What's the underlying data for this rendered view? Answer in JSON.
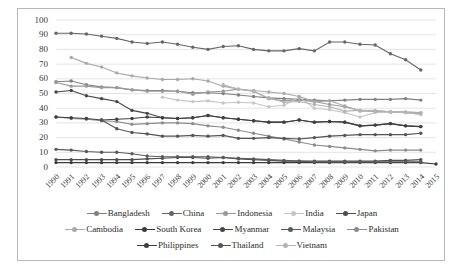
{
  "chart_data": {
    "type": "line",
    "title": "",
    "xlabel": "",
    "ylabel": "",
    "ylim": [
      0,
      100
    ],
    "ytick_step": 10,
    "yticks": [
      0,
      10,
      20,
      30,
      40,
      50,
      60,
      70,
      80,
      90,
      100
    ],
    "grid": true,
    "grid_axis": "y",
    "legend_position": "bottom",
    "x": [
      1990,
      1991,
      1992,
      1993,
      1994,
      1995,
      1996,
      1997,
      1998,
      1999,
      2000,
      2001,
      2002,
      2003,
      2004,
      2005,
      2006,
      2007,
      2008,
      2009,
      2010,
      2011,
      2012,
      2013,
      2014,
      2015
    ],
    "categories": [
      "1990",
      "1991",
      "1992",
      "1993",
      "1994",
      "1995",
      "1996",
      "1997",
      "1998",
      "1999",
      "2000",
      "2001",
      "2002",
      "2003",
      "2004",
      "2005",
      "2006",
      "2007",
      "2008",
      "2009",
      "2010",
      "2011",
      "2012",
      "2013",
      "2014",
      "2015"
    ],
    "series": [
      {
        "name": "Bangladesh",
        "color": "#808080",
        "values": [
          58,
          58.5,
          56,
          54.5,
          54,
          52.5,
          52,
          52,
          51.5,
          50.5,
          50.5,
          50,
          49,
          48,
          47,
          46.5,
          46,
          45.5,
          45,
          45.5,
          46,
          46,
          46,
          46.5,
          45.5,
          null
        ]
      },
      {
        "name": "China",
        "color": "#666666",
        "values": [
          91,
          91,
          90.5,
          89,
          87.5,
          85,
          84,
          85,
          83.5,
          81.5,
          80,
          82,
          82.5,
          80,
          79,
          79,
          80.5,
          79,
          85,
          85,
          83.5,
          83,
          77,
          73,
          66,
          null
        ]
      },
      {
        "name": "Indonesia",
        "color": "#9a9a9a",
        "values": [
          57.5,
          55,
          55,
          54,
          54,
          52.5,
          51.5,
          51.5,
          51.5,
          49.5,
          51,
          51.5,
          53,
          51.5,
          46.5,
          45,
          45.5,
          44.5,
          42.5,
          41,
          38.5,
          38,
          37.5,
          37,
          36,
          null
        ]
      },
      {
        "name": "India",
        "color": "#c6c6c6",
        "values": [
          null,
          null,
          null,
          null,
          null,
          null,
          null,
          47.5,
          45.5,
          44.5,
          45,
          43.5,
          44,
          43.5,
          41,
          42,
          47.5,
          40,
          39,
          37,
          34,
          37,
          37.5,
          37,
          36.5,
          null
        ]
      },
      {
        "name": "Japan",
        "color": "#4d4d4d",
        "values": [
          5,
          5,
          5,
          5,
          5,
          5,
          5.5,
          6,
          6.5,
          6.5,
          6,
          6.5,
          5.5,
          5,
          4.5,
          4,
          4,
          4,
          4,
          4,
          4,
          4,
          4.5,
          4.5,
          5,
          null
        ]
      },
      {
        "name": "Cambodia",
        "color": "#a9a9a9",
        "values": [
          null,
          74.5,
          70.5,
          68,
          64,
          62,
          60.5,
          59.5,
          59.5,
          60,
          58.5,
          55,
          53,
          52,
          51,
          50,
          48,
          44.5,
          45,
          41.5,
          38,
          38,
          37.5,
          37.5,
          37,
          null
        ]
      },
      {
        "name": "South Korea",
        "color": "#3b3b3b",
        "values": [
          3,
          3,
          3,
          3,
          3,
          3,
          3,
          3,
          3,
          3,
          3,
          3,
          3,
          3,
          3,
          3,
          3,
          3,
          3,
          3,
          3,
          3,
          3,
          3,
          3,
          2
        ]
      },
      {
        "name": "Myanmar",
        "color": "#464646",
        "values": [
          51,
          52,
          48.5,
          46.5,
          44.5,
          38.5,
          36.5,
          33.5,
          33,
          33.5,
          35,
          33.5,
          32.5,
          31.5,
          30.5,
          30.5,
          32,
          30.5,
          31,
          30.5,
          28,
          28.5,
          29.5,
          28,
          27.5,
          null
        ]
      },
      {
        "name": "Malaysia",
        "color": "#5a5a5a",
        "values": [
          12,
          11.5,
          10.5,
          10,
          10,
          9,
          7.5,
          7,
          7,
          7,
          7,
          6.5,
          6,
          5.5,
          5,
          4.5,
          4,
          3.5,
          3.5,
          3.5,
          3.5,
          3.5,
          3.5,
          3.5,
          3.5,
          null
        ]
      },
      {
        "name": "Pakistan",
        "color": "#8c8c8c",
        "values": [
          34,
          33,
          32.5,
          31.5,
          31,
          29,
          29.5,
          30,
          30,
          29.5,
          28,
          27,
          25,
          23,
          21,
          19,
          17,
          15,
          14,
          13,
          12,
          11,
          11.5,
          11.5,
          11.5,
          null
        ]
      },
      {
        "name": "Philippines",
        "color": "#3f3f3f",
        "values": [
          34,
          33.5,
          33,
          32,
          32.5,
          33,
          34,
          33.5,
          33,
          33.5,
          35,
          33.5,
          32.5,
          31.5,
          30.5,
          30.5,
          32,
          30.5,
          31,
          30.5,
          28,
          28.5,
          29.5,
          28,
          27.5,
          null
        ]
      },
      {
        "name": "Thailand",
        "color": "#555555",
        "values": [
          null,
          null,
          null,
          32,
          26,
          23.5,
          22.5,
          21,
          21,
          21.5,
          21,
          21.5,
          19.5,
          19.5,
          20,
          19.5,
          19,
          20,
          21,
          21.5,
          22,
          22,
          22,
          22,
          23,
          null
        ]
      },
      {
        "name": "Vietnam",
        "color": "#b5b5b5",
        "values": [
          null,
          null,
          null,
          null,
          null,
          null,
          null,
          null,
          null,
          null,
          null,
          56,
          53,
          51.5,
          47,
          44,
          44.5,
          42.5,
          41,
          38,
          38.5,
          38.5,
          37.5,
          37,
          36,
          null
        ]
      }
    ]
  },
  "legend": {
    "rows": [
      [
        "Bangladesh",
        "China",
        "Indonesia",
        "India",
        "Japan"
      ],
      [
        "Cambodia",
        "South Korea",
        "Myanmar",
        "Malaysia",
        "Pakistan"
      ],
      [
        "Philippines",
        "Thailand",
        "Vietnam"
      ]
    ]
  }
}
